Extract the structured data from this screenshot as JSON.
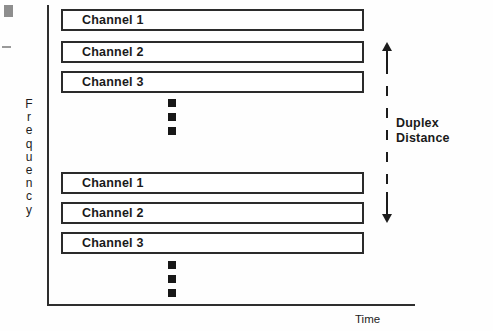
{
  "figure": {
    "type": "frequency-division-duplex-diagram",
    "axes": {
      "y_label": "Frequency",
      "y_label_letters": [
        "F",
        "r",
        "e",
        "q",
        "u",
        "e",
        "n",
        "c",
        "y"
      ],
      "x_label": "Time"
    },
    "upper_group": {
      "channels": [
        {
          "label": "Channel 1"
        },
        {
          "label": "Channel 2"
        },
        {
          "label": "Channel 3"
        }
      ],
      "ellipsis_dots": 3
    },
    "lower_group": {
      "channels": [
        {
          "label": "Channel 1"
        },
        {
          "label": "Channel 2"
        },
        {
          "label": "Channel 3"
        }
      ],
      "ellipsis_dots": 3
    },
    "annotation": {
      "line1": "Duplex",
      "line2": "Distance"
    },
    "colors": {
      "stroke": "#2b2b2b",
      "text": "#1a1a1a",
      "background": "#fefefe",
      "scan_mark": "#8e8e8e"
    }
  }
}
